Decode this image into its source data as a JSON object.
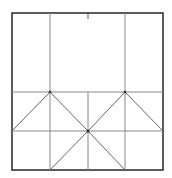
{
  "diagram": {
    "type": "geometric-grid-pattern",
    "background": "#ffffff",
    "outer_border_color": "#333333",
    "line_color": "#777777",
    "diagonal_color": "#666666",
    "outer_box": {
      "x1": 12,
      "y1": 13,
      "x2": 163,
      "y2": 170
    },
    "vertical_lines_x": [
      50,
      125
    ],
    "center_vertical_x": 88,
    "horizontal_lines_y": [
      92,
      131
    ],
    "tick": {
      "x": 88,
      "y1": 13,
      "y2": 19
    },
    "points": {
      "top_left_apex": [
        50,
        92
      ],
      "top_right_apex": [
        125,
        92
      ],
      "center": [
        88,
        131
      ],
      "left_mid": [
        12,
        131
      ],
      "right_mid": [
        163,
        131
      ],
      "bottom_left": [
        50,
        170
      ],
      "bottom_right": [
        125,
        170
      ]
    }
  }
}
